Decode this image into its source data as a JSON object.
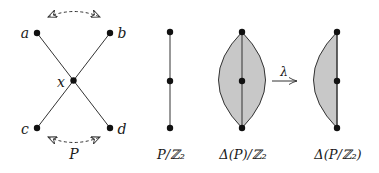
{
  "figure": {
    "poset": {
      "nodes": [
        {
          "id": "a",
          "label": "a"
        },
        {
          "id": "b",
          "label": "b"
        },
        {
          "id": "x",
          "label": "x"
        },
        {
          "id": "c",
          "label": "c"
        },
        {
          "id": "d",
          "label": "d"
        }
      ],
      "caption": "P"
    },
    "quotient": {
      "caption": "P/ℤ₂"
    },
    "delta_quotient": {
      "caption": "Δ(P)/ℤ₂"
    },
    "arrow": {
      "label": "λ"
    },
    "delta_of_quotient": {
      "caption": "Δ(P/ℤ₂)"
    },
    "colors": {
      "stroke": "#333333",
      "node": "#111111",
      "fill": "#c8c8c8"
    }
  }
}
